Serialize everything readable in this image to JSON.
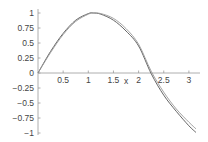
{
  "chart_data": {
    "type": "line",
    "title": "",
    "xlabel": "x",
    "ylabel": "",
    "xlim": [
      0,
      3.14
    ],
    "ylim": [
      -1,
      1
    ],
    "grid": false,
    "legend": null,
    "x_ticks": [
      "0.5",
      "1",
      "1.5",
      "2",
      "2.5",
      "3"
    ],
    "y_ticks": [
      "1",
      "0.75",
      "0.5",
      "0.25",
      "0",
      "-0.25",
      "-0.5",
      "-0.75",
      "-1"
    ],
    "series": [
      {
        "name": "curve 1",
        "color": "#555555",
        "x": [
          0,
          0.25,
          0.5,
          0.75,
          1.0,
          1.1,
          1.25,
          1.5,
          1.75,
          2.0,
          2.25,
          2.5,
          2.75,
          3.0,
          3.14
        ],
        "values": [
          0,
          0.36,
          0.66,
          0.88,
          0.99,
          1.0,
          0.98,
          0.88,
          0.7,
          0.45,
          -0.01,
          -0.37,
          -0.64,
          -0.88,
          -0.99
        ]
      },
      {
        "name": "curve 2",
        "color": "#999999",
        "x": [
          0,
          0.25,
          0.5,
          0.75,
          1.0,
          1.1,
          1.25,
          1.5,
          1.75,
          2.0,
          2.25,
          2.5,
          2.75,
          3.0,
          3.14
        ],
        "values": [
          0,
          0.34,
          0.64,
          0.86,
          0.98,
          1.0,
          0.99,
          0.91,
          0.74,
          0.48,
          0.03,
          -0.32,
          -0.6,
          -0.82,
          -0.93
        ]
      }
    ]
  }
}
